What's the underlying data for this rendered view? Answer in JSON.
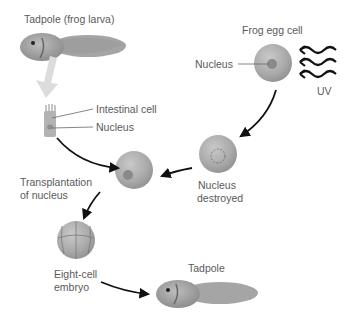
{
  "diagram": {
    "type": "process-cycle",
    "topic": "Nuclear transplantation cloning in frogs",
    "labels": {
      "tadpole_larva": "Tadpole (frog larva)",
      "intestinal_cell": "Intestinal cell",
      "nucleus_intestinal": "Nucleus",
      "frog_egg_cell": "Frog egg cell",
      "nucleus_egg": "Nucleus",
      "uv": "UV",
      "nucleus_destroyed_1": "Nucleus",
      "nucleus_destroyed_2": "destroyed",
      "transplantation_1": "Transplantation",
      "transplantation_2": "of nucleus",
      "eight_cell_1": "Eight-cell",
      "eight_cell_2": "embryo",
      "tadpole_result": "Tadpole"
    },
    "steps": [
      "Tadpole (frog larva)",
      "Intestinal cell",
      "Frog egg cell",
      "Nucleus destroyed",
      "Transplantation of nucleus",
      "Eight-cell embryo",
      "Tadpole"
    ],
    "colors": {
      "cell_fill": "#a8a8a8",
      "nucleus_fill": "#8a8a8a",
      "arrow": "#111111",
      "big_arrow": "#d9d9d9",
      "text": "#5a5a5a"
    }
  }
}
